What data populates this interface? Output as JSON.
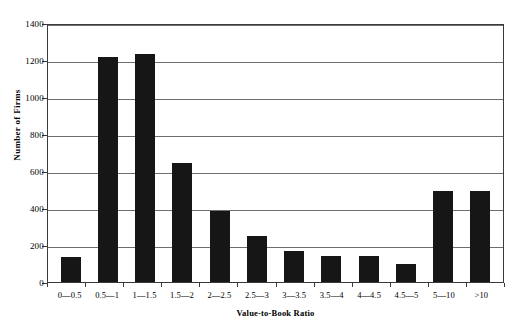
{
  "chart_data": {
    "type": "bar",
    "title": "",
    "xlabel": "Value-to-Book Ratio",
    "ylabel": "Number of Firms",
    "categories": [
      "0—0.5",
      "0.5—1",
      "1—1.5",
      "1.5—2",
      "2—2.5",
      "2.5—3",
      "3—3.5",
      "3.5—4",
      "4—4.5",
      "4.5—5",
      "5—10",
      ">10"
    ],
    "values": [
      136,
      1215,
      1230,
      643,
      382,
      250,
      165,
      142,
      142,
      100,
      490,
      490
    ],
    "ylim": [
      0,
      1400
    ],
    "ytick_labels": [
      "0",
      "200",
      "400",
      "600",
      "800",
      "1000",
      "1200",
      "1400"
    ],
    "ytick_values": [
      0,
      200,
      400,
      600,
      800,
      1000,
      1200,
      1400
    ],
    "grid": "horizontal",
    "legend": "none",
    "bar_color": "#161616",
    "axis_color": "#3a3a3a",
    "grid_color": "#6e6e6e",
    "background": "#ffffff"
  }
}
